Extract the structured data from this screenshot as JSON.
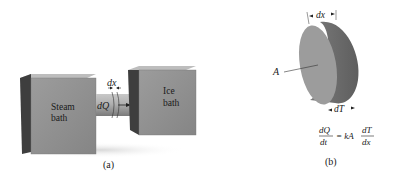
{
  "panel_a": {
    "caption": "(a)",
    "left_box": {
      "line1": "Steam",
      "line2": "bath"
    },
    "right_box": {
      "line1": "Ice",
      "line2": "bath"
    },
    "rod_labels": {
      "width": "dx",
      "heat": "dQ"
    }
  },
  "panel_b": {
    "caption": "(b)",
    "area_label": "A",
    "thickness_label": "dx",
    "temp_label": "dT",
    "equation": {
      "lhs_num": "dQ",
      "lhs_den": "dt",
      "middle": "= kA",
      "rhs_num": "dT",
      "rhs_den": "dx"
    }
  },
  "colors": {
    "box_front": "#8f8f8f",
    "box_top": "#b8b8b8",
    "box_side": "#4a4a4a",
    "rod": "#a8a8a8",
    "disc_face": "#9a9a9a",
    "disc_edge": "#6e6e6e"
  }
}
